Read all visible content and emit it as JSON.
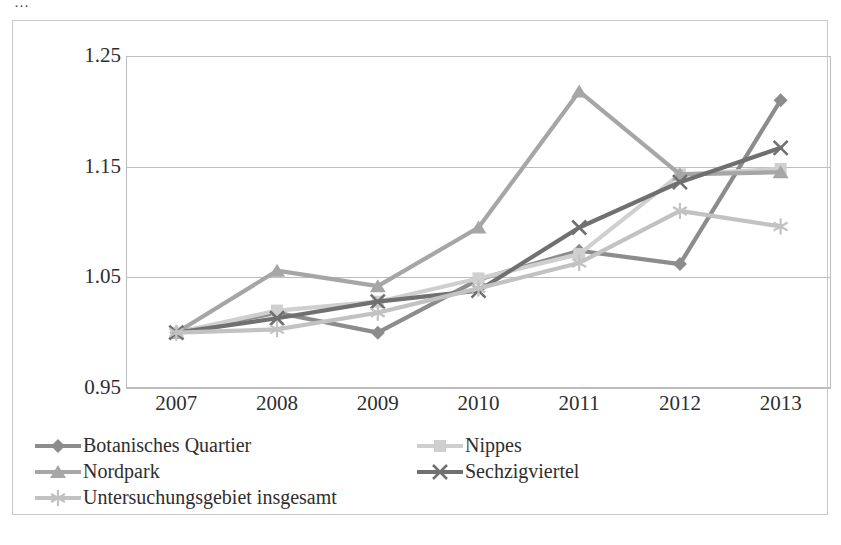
{
  "top_clipped_caption": "…",
  "chart_data": {
    "type": "line",
    "title": "",
    "subtitle": "",
    "xlabel": "",
    "ylabel": "",
    "categories": [
      "2007",
      "2008",
      "2009",
      "2010",
      "2011",
      "2012",
      "2013"
    ],
    "x": [
      2007,
      2008,
      2009,
      2010,
      2011,
      2012,
      2013
    ],
    "ylim": [
      0.95,
      1.25
    ],
    "yticks": [
      "0.95",
      "1.05",
      "1.15",
      "1.25"
    ],
    "ytick_values": [
      0.95,
      1.05,
      1.15,
      1.25
    ],
    "grid": true,
    "grid_axis": "y",
    "legend_position": "bottom",
    "legend_columns": 2,
    "series": [
      {
        "name": "Botanisches Quartier",
        "marker": "diamond",
        "color": "#8c8c8c",
        "values": [
          1.0,
          1.018,
          1.0,
          1.048,
          1.074,
          1.062,
          1.21
        ]
      },
      {
        "name": "Nippes",
        "marker": "square",
        "color": "#cfcfcf",
        "values": [
          1.0,
          1.02,
          1.028,
          1.049,
          1.071,
          1.143,
          1.148
        ]
      },
      {
        "name": "Nordpark",
        "marker": "triangle",
        "color": "#a6a6a6",
        "values": [
          1.0,
          1.056,
          1.042,
          1.095,
          1.218,
          1.143,
          1.145
        ]
      },
      {
        "name": "Sechzigviertel",
        "marker": "x",
        "color": "#707070",
        "values": [
          1.0,
          1.013,
          1.028,
          1.038,
          1.095,
          1.136,
          1.167
        ]
      },
      {
        "name": "Untersuchungsgebiet insgesamt",
        "marker": "asterisk",
        "color": "#c2c2c2",
        "values": [
          1.0,
          1.003,
          1.018,
          1.04,
          1.063,
          1.11,
          1.096
        ]
      }
    ]
  },
  "axis": {
    "y_ticks": [
      "1.25",
      "1.15",
      "1.05",
      "0.95"
    ],
    "x_ticks": [
      "2007",
      "2008",
      "2009",
      "2010",
      "2011",
      "2012",
      "2013"
    ]
  },
  "legend": {
    "items": [
      {
        "label": "Botanisches Quartier",
        "marker": "diamond-marker",
        "color": "#8c8c8c"
      },
      {
        "label": "Nippes",
        "marker": "square-marker",
        "color": "#cfcfcf"
      },
      {
        "label": "Nordpark",
        "marker": "triangle-marker",
        "color": "#a6a6a6"
      },
      {
        "label": "Sechzigviertel",
        "marker": "x-marker",
        "color": "#707070"
      },
      {
        "label": "Untersuchungsgebiet insgesamt",
        "marker": "asterisk-marker",
        "color": "#c2c2c2"
      }
    ]
  }
}
